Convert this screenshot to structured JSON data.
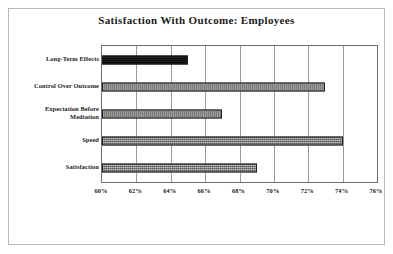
{
  "figure": {
    "title": "Satisfaction With Outcome: Employees",
    "frame_color": "#b9b9b9",
    "background": "#ffffff"
  },
  "chart_data": {
    "type": "bar",
    "orientation": "horizontal",
    "title": "Satisfaction With Outcome: Employees",
    "xlabel": "",
    "ylabel": "",
    "categories": [
      "Long-Term Effects",
      "Control Over Outcome",
      "Expectation Before Mediation",
      "Speed",
      "Satisfaction"
    ],
    "category_lines": [
      [
        "Long-Term Effects"
      ],
      [
        "Control Over Outcome"
      ],
      [
        "Expectation Before",
        "Mediation"
      ],
      [
        "Speed"
      ],
      [
        "Satisfaction"
      ]
    ],
    "values": [
      65,
      73,
      67,
      74,
      69
    ],
    "value_labels": [
      "65%",
      "73%",
      "67%",
      "74%",
      "69%"
    ],
    "bar_colors": [
      "#0c0c0c",
      "#787878",
      "#787878",
      "#787878",
      "#787878"
    ],
    "xlim": [
      60,
      76
    ],
    "xticks": [
      60,
      62,
      64,
      66,
      68,
      70,
      72,
      74,
      76
    ],
    "xtick_labels": [
      "60%",
      "62%",
      "64%",
      "66%",
      "68%",
      "70%",
      "72%",
      "74%",
      "76%"
    ],
    "grid": {
      "vertical": true,
      "horizontal": false,
      "color": "#9a9a9a"
    },
    "legend": null,
    "axis_border_color": "#6e6e6e"
  }
}
